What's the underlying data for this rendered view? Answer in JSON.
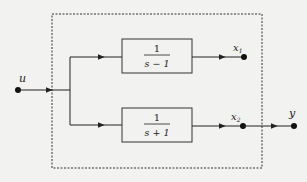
{
  "diagram": {
    "input_label": "u",
    "output_label": "y",
    "blocks": [
      {
        "id": "top",
        "numerator": "1",
        "denominator": "s − 1",
        "output_label": "x",
        "output_sub": "1"
      },
      {
        "id": "bottom",
        "numerator": "1",
        "denominator": "s + 1",
        "output_label": "x",
        "output_sub": "2"
      }
    ],
    "colors": {
      "line": "#222222",
      "background": "#f2f2f0"
    }
  }
}
